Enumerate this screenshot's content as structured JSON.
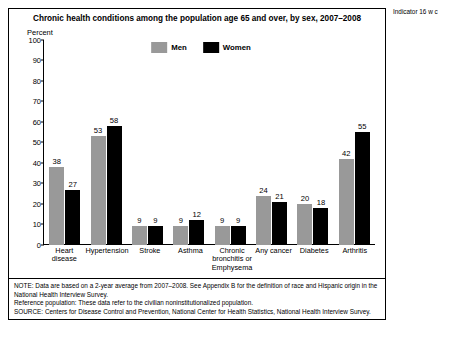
{
  "chart_data": {
    "type": "bar",
    "title": "Chronic health conditions among the population age 65 and over, by sex, 2007–2008",
    "xlabel": "",
    "ylabel": "Percent",
    "ylim": [
      0,
      100
    ],
    "yticks": [
      100,
      90,
      80,
      70,
      60,
      50,
      40,
      30,
      20,
      10,
      0
    ],
    "grid": false,
    "legend_position": "top-center",
    "categories": [
      "Heart disease",
      "Hypertension",
      "Stroke",
      "Asthma",
      "Chronic bronchitis or Emphysema",
      "Any cancer",
      "Diabetes",
      "Arthritis"
    ],
    "category_lines": [
      [
        "Heart",
        "disease"
      ],
      [
        "Hypertension"
      ],
      [
        "Stroke"
      ],
      [
        "Asthma"
      ],
      [
        "Chronic",
        "bronchitis or",
        "Emphysema"
      ],
      [
        "Any cancer"
      ],
      [
        "Diabetes"
      ],
      [
        "Arthritis"
      ]
    ],
    "series": [
      {
        "name": "Men",
        "color": "#999999",
        "values": [
          38,
          53,
          9,
          9,
          9,
          24,
          20,
          42
        ]
      },
      {
        "name": "Women",
        "color": "#000000",
        "values": [
          27,
          58,
          9,
          12,
          9,
          21,
          18,
          55
        ]
      }
    ]
  },
  "notes": {
    "note1": "NOTE: Data are based on a 2-year average from 2007–2008. See Appendix B for the definition of race and Hispanic origin in the National Health Interview Survey.",
    "note2": "Reference population: These data refer to the civilian noninstitutionalized population.",
    "note3": "SOURCE: Centers for Disease Control and Prevention, National Center for Health Statistics, National Health Interview Survey."
  },
  "side_text": "Indicator 16\nw\nc"
}
